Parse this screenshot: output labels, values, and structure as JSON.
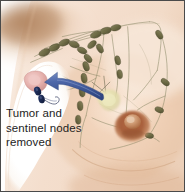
{
  "figure": {
    "width": 185,
    "height": 192
  },
  "caption": {
    "line1": "Tumor and",
    "line2": "sentinel nodes",
    "line3": "removed",
    "text": "Tumor and sentinel nodes removed",
    "color": "#1d1d1d"
  },
  "labels": {
    "tumor": "tumor",
    "sentinel_nodes": "sentinel nodes",
    "lymph_nodes": "axillary lymph nodes",
    "lymph_vessels": "lymphatic vessels",
    "nipple": "nipple",
    "areola": "areola",
    "mass": "yellow mass",
    "surgical_field": "white surgical field",
    "arrow": "removal arrow"
  },
  "colors": {
    "border": "#4a4a4a",
    "background": "#ffffff",
    "skin_light": "#f6e3d4",
    "skin_mid": "#eccaae",
    "skin_deep": "#d9a983",
    "axilla_shadow": "#b98a63",
    "areola": "#a9613c",
    "nipple": "#c98a63",
    "lymph_node": "#6d6b46",
    "lymph_node_dark": "#4f4e31",
    "lymph_vessel": "#8d8a6a",
    "sentinel_node": "#1c2a55",
    "tumor": "#e9b8b6",
    "tumor_edge": "#c98e8e",
    "mass": "#e6e3b4",
    "arrow": "#4a66a8",
    "arrow_dark": "#33518f",
    "field_white": "#ffffff"
  },
  "counts": {
    "lymph_nodes": 22,
    "sentinel_nodes": 2,
    "tumors": 1
  }
}
